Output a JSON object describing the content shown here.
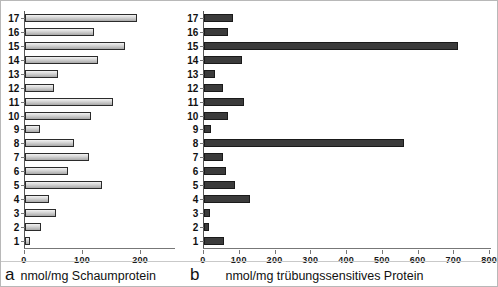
{
  "figure": {
    "width": 498,
    "height": 287,
    "background": "#ffffff",
    "border_color": "#b8b8b8"
  },
  "panels": [
    {
      "letter": "a",
      "name": "panel-a"
    },
    {
      "letter": "b",
      "name": "panel-b"
    }
  ],
  "chart_data": [
    {
      "type": "bar",
      "orientation": "horizontal",
      "panel_letter": "a",
      "title": "",
      "xlabel": "nmol/mg Schaumprotein",
      "ylabel": "",
      "xlim": [
        0,
        260
      ],
      "xticks": [
        0,
        100,
        200
      ],
      "xtick_labels": [
        "0",
        "100",
        "200"
      ],
      "grid": false,
      "legend": false,
      "bar_color": "#d4d4d4",
      "bar_edge_color": "#2b2b2b",
      "categories": [
        "1",
        "2",
        "3",
        "4",
        "5",
        "6",
        "7",
        "8",
        "9",
        "10",
        "11",
        "12",
        "13",
        "14",
        "15",
        "16",
        "17"
      ],
      "values": [
        8,
        28,
        53,
        42,
        134,
        75,
        111,
        85,
        26,
        115,
        152,
        50,
        58,
        126,
        174,
        120,
        194
      ]
    },
    {
      "type": "bar",
      "orientation": "horizontal",
      "panel_letter": "b",
      "title": "",
      "xlabel": "nmol/mg trübungssensitives Protein",
      "ylabel": "",
      "xlim": [
        0,
        805
      ],
      "xticks": [
        0,
        100,
        200,
        300,
        400,
        500,
        600,
        700,
        800
      ],
      "xtick_labels": [
        "0",
        "100",
        "200",
        "300",
        "400",
        "500",
        "600",
        "700",
        "800"
      ],
      "grid": false,
      "legend": false,
      "bar_color": "#3b3b3b",
      "bar_edge_color": "#1a1a1a",
      "categories": [
        "1",
        "2",
        "3",
        "4",
        "5",
        "6",
        "7",
        "8",
        "9",
        "10",
        "11",
        "12",
        "13",
        "14",
        "15",
        "16",
        "17"
      ],
      "values": [
        56,
        14,
        18,
        129,
        87,
        62,
        52,
        562,
        21,
        66,
        112,
        52,
        31,
        107,
        712,
        66,
        82
      ]
    }
  ]
}
